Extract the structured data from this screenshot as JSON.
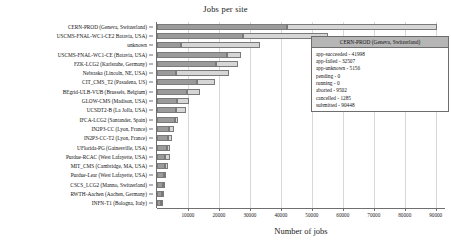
{
  "chart_data": {
    "type": "bar",
    "orientation": "horizontal",
    "stacked": true,
    "title": "Jobs per site",
    "xlabel": "Number of jobs",
    "ylabel": "",
    "xlim": [
      0,
      93000
    ],
    "xticks": [
      10000,
      20000,
      30000,
      40000,
      50000,
      60000,
      70000,
      80000,
      90000
    ],
    "xticklabels": [
      "10000",
      "20000",
      "30000",
      "40000",
      "50000",
      "60000",
      "70000",
      "80000",
      "90000"
    ],
    "grid": true,
    "legend": "none",
    "series": [
      {
        "name": "app-succeeded",
        "color": "#9b9b9b"
      },
      {
        "name": "app-failed",
        "color": "#d6d6d6"
      }
    ],
    "categories": [
      "CERN-PROD (Geneva, Switzerland)",
      "USCMS-FNAL-WC1-CE2 Batavia, USA)",
      "unknown",
      "USCMS-FNAL-WC1-CE (Batavia, USA)",
      "FZK-LCG2 (Karlsruhe, Germany)",
      "Nebraska (Lincoln, NE, USA)",
      "CIT_CMS_T2 (Pasadena, US)",
      "BEgrid-ULB-VUB (Brussels, Belgium)",
      "GLOW-CMS (Madison, USA)",
      "UCSDT2-B (La Jolla, USA)",
      "IFCA-LCG2 (Santander, Spain)",
      "IN2P3-CC (Lyon, France)",
      "IN2P3-CC-T2 (Lyon, France)",
      "UFlorida-PG (Gainesville, USA)",
      "Purdue-RCAC (West Lafayette, USA)",
      "MIT_CMS (Cambridge, MA, USA)",
      "Purdue-Lear (West Lafayette, USA)",
      "CSCS_LCG2 (Manno, Switzerland)",
      "RWTH-Aachen (Aachen, Germany)",
      "INFN-T1 (Bologna, Italy)"
    ],
    "values": [
      [
        41998,
        48450
      ],
      [
        27800,
        27300
      ],
      [
        7600,
        25600
      ],
      [
        22600,
        4500
      ],
      [
        19000,
        7000
      ],
      [
        6100,
        17300
      ],
      [
        12900,
        5900
      ],
      [
        9600,
        4200
      ],
      [
        6400,
        3900
      ],
      [
        6100,
        3200
      ],
      [
        5900,
        1000
      ],
      [
        3900,
        1500
      ],
      [
        3400,
        1500
      ],
      [
        3100,
        1200
      ],
      [
        2700,
        1500
      ],
      [
        2500,
        1000
      ],
      [
        2100,
        900
      ],
      [
        1900,
        800
      ],
      [
        1700,
        700
      ],
      [
        1200,
        600
      ]
    ]
  },
  "tooltip": {
    "title": "CERN-PROD (Geneva, Switzerland)",
    "rows": [
      "app-succeeded - 41998",
      "app-failed - 32507",
      "app-unknown - 5156",
      "pending - 0",
      "running - 0",
      "aborted - 9502",
      "cancelled - 1285",
      "submitted - 90448"
    ]
  }
}
